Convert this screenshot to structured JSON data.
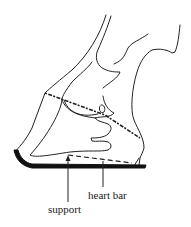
{
  "diagram": {
    "labels": {
      "heart_bar": "heart bar",
      "support": "support"
    },
    "colors": {
      "ink": "#222222",
      "background": "#ffffff"
    }
  }
}
